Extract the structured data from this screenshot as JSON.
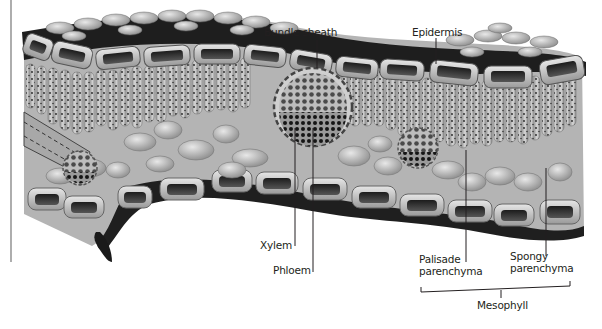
{
  "diagram": {
    "labels": {
      "bundle_sheath": "Bundle sheath",
      "epidermis": "Epidermis",
      "xylem": "Xylem",
      "phloem": "Phloem",
      "palisade_line1": "Palisade",
      "palisade_line2": "parenchyma",
      "spongy_line1": "Spongy",
      "spongy_line2": "parenchyma",
      "mesophyll": "Mesophyll"
    },
    "colors": {
      "background": "#ffffff",
      "leader_line": "#231f20",
      "label_text": "#231f20",
      "tissue_dark": "#2a2a2a",
      "tissue_mid": "#8a8a8a",
      "tissue_light": "#d6d6d6"
    }
  }
}
